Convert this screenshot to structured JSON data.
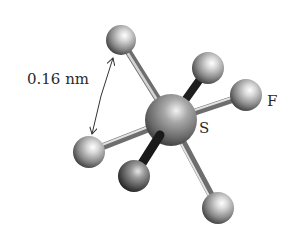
{
  "diagram": {
    "labels": {
      "distance": "0.16 nm",
      "fluorine": "F",
      "sulfur": "S"
    },
    "central_atom": {
      "element": "S",
      "cx": 171,
      "cy": 120,
      "r": 26
    },
    "atoms": [
      {
        "id": "f-top-left",
        "element": "F",
        "cx": 121,
        "cy": 40,
        "r": 15,
        "layer": "back"
      },
      {
        "id": "f-upper-back",
        "element": "F",
        "cx": 208,
        "cy": 68,
        "r": 16,
        "layer": "back"
      },
      {
        "id": "f-right",
        "element": "F",
        "cx": 246,
        "cy": 95,
        "r": 16,
        "layer": "front"
      },
      {
        "id": "f-left",
        "element": "F",
        "cx": 89,
        "cy": 152,
        "r": 16,
        "layer": "front"
      },
      {
        "id": "f-lower-front",
        "element": "F",
        "cx": 134,
        "cy": 176,
        "r": 16,
        "layer": "front"
      },
      {
        "id": "f-bottom-right",
        "element": "F",
        "cx": 218,
        "cy": 208,
        "r": 16,
        "layer": "front"
      }
    ],
    "measurement": {
      "from": [
        113,
        58
      ],
      "to": [
        92,
        134
      ]
    },
    "colors": {
      "atom_light": "#f4f4f4",
      "atom_mid": "#9a9a9a",
      "atom_dark": "#3a3a3a",
      "bond": "#8a8a8a",
      "text": "#2a2a2a"
    }
  }
}
